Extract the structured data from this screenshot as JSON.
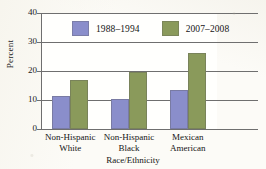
{
  "chart_data": {
    "type": "bar",
    "title": "",
    "xlabel": "Race/Ethnicity",
    "ylabel": "Percent",
    "ylim": [
      0,
      40
    ],
    "yticks": [
      0,
      10,
      20,
      30,
      40
    ],
    "ytick_labels": [
      "0",
      "10",
      "20",
      "30",
      "40"
    ],
    "grid": true,
    "legend_position": "top-inside",
    "categories": [
      "Non-Hispanic White",
      "Non-Hispanic Black",
      "Mexican American"
    ],
    "category_lines": [
      [
        "Non-Hispanic",
        "White"
      ],
      [
        "Non-Hispanic",
        "Black"
      ],
      [
        "Mexican",
        "American"
      ]
    ],
    "series": [
      {
        "name": "1988–1994",
        "color": "#8a8ecb",
        "values": [
          11.5,
          10.3,
          13.5
        ]
      },
      {
        "name": "2007–2008",
        "color": "#8a9a5b",
        "values": [
          16.8,
          19.5,
          26.2
        ]
      }
    ]
  },
  "legend": {
    "items": [
      {
        "label": "1988–1994"
      },
      {
        "label": "2007–2008"
      }
    ]
  },
  "axes": {
    "y_title": "Percent",
    "x_title": "Race/Ethnicity"
  }
}
